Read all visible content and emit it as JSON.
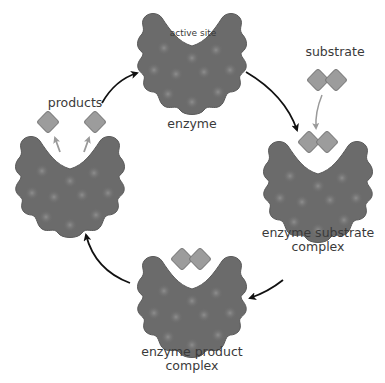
{
  "diagram": {
    "title": "",
    "type": "enzyme catalytic cycle",
    "colors": {
      "enzyme_body": "#6b6b6b",
      "enzyme_outline": "#5a5a5a",
      "enzyme_spot": "#858585",
      "molecule_fill": "#9c9c9c",
      "molecule_outline": "#7a7a7a",
      "molecule_glow": "#ffffff",
      "cycle_arrow": "#111111",
      "minor_arrow": "#9a9a9a",
      "text": "#3a3a3a",
      "background": "#ffffff"
    },
    "stages": [
      {
        "id": "enzyme",
        "label": "enzyme",
        "sublabel": "active site"
      },
      {
        "id": "enzyme-substrate-complex",
        "label_line1": "enzyme substrate",
        "label_line2": "complex"
      },
      {
        "id": "enzyme-product-complex",
        "label_line1": "enzyme product",
        "label_line2": "complex"
      },
      {
        "id": "products-released",
        "label": "products"
      }
    ],
    "inputs": {
      "substrate_label": "substrate"
    },
    "flow": [
      {
        "from": "enzyme",
        "to": "enzyme-substrate-complex"
      },
      {
        "from": "enzyme-substrate-complex",
        "to": "enzyme-product-complex"
      },
      {
        "from": "enzyme-product-complex",
        "to": "products-released"
      },
      {
        "from": "products-released",
        "to": "enzyme"
      }
    ]
  }
}
